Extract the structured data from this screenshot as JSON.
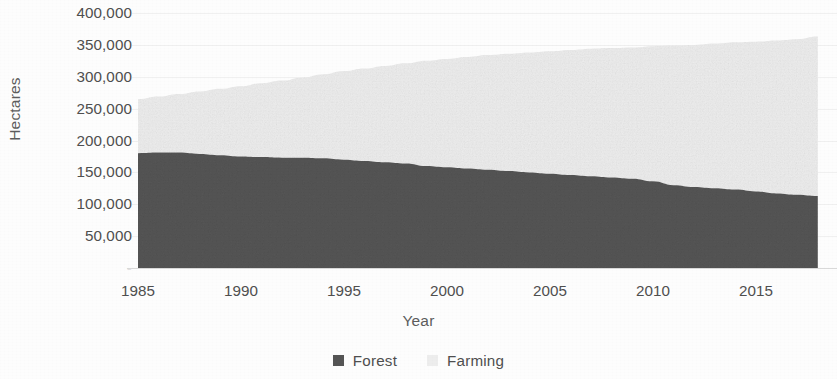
{
  "chart_data": {
    "type": "area",
    "stacked": true,
    "title": "",
    "xlabel": "Year",
    "ylabel": "Hectares",
    "xlim": [
      1985,
      2018
    ],
    "ylim": [
      0,
      400000
    ],
    "grid": true,
    "legend_position": "bottom",
    "y_ticks": [
      0,
      50000,
      100000,
      150000,
      200000,
      250000,
      300000,
      350000,
      400000
    ],
    "y_tick_labels": [
      "-",
      "50,000",
      "100,000",
      "150,000",
      "200,000",
      "250,000",
      "300,000",
      "350,000",
      "400,000"
    ],
    "x_ticks": [
      1985,
      1990,
      1995,
      2000,
      2005,
      2010,
      2015
    ],
    "x_tick_labels": [
      "1985",
      "1990",
      "1995",
      "2000",
      "2005",
      "2010",
      "2015"
    ],
    "x": [
      1985,
      1986,
      1987,
      1988,
      1989,
      1990,
      1991,
      1992,
      1993,
      1994,
      1995,
      1996,
      1997,
      1998,
      1999,
      2000,
      2001,
      2002,
      2003,
      2004,
      2005,
      2006,
      2007,
      2008,
      2009,
      2010,
      2011,
      2012,
      2013,
      2014,
      2015,
      2016,
      2017,
      2018
    ],
    "series": [
      {
        "name": "Forest",
        "color": "#555555",
        "values": [
          180000,
          181000,
          181000,
          179000,
          177000,
          175000,
          174000,
          173000,
          173000,
          172000,
          170000,
          168000,
          166000,
          164000,
          160000,
          158000,
          156000,
          154000,
          152000,
          150000,
          148000,
          146000,
          144000,
          142000,
          140000,
          136000,
          130000,
          127000,
          125000,
          123000,
          120000,
          117000,
          115000,
          113000
        ]
      },
      {
        "name": "Farming",
        "color": "#ededed",
        "values": [
          85000,
          88000,
          92000,
          98000,
          104000,
          110000,
          116000,
          121000,
          126000,
          132000,
          139000,
          145000,
          151000,
          157000,
          165000,
          170000,
          175000,
          180000,
          184000,
          188000,
          192000,
          196000,
          200000,
          203000,
          206000,
          212000,
          219000,
          223000,
          227000,
          231000,
          235000,
          240000,
          244000,
          250000
        ]
      }
    ],
    "totals": [
      265000,
      269000,
      273000,
      277000,
      281000,
      285000,
      290000,
      294000,
      299000,
      304000,
      309000,
      313000,
      317000,
      321000,
      325000,
      328000,
      331000,
      334000,
      336000,
      338000,
      340000,
      342000,
      344000,
      345000,
      346000,
      348000,
      349000,
      350000,
      352000,
      354000,
      355000,
      357000,
      359000,
      363000
    ]
  },
  "legend": {
    "items": [
      {
        "label": "Forest",
        "color": "#555555"
      },
      {
        "label": "Farming",
        "color": "#ededed"
      }
    ]
  },
  "colors": {
    "forest": "#555555",
    "farming": "#ededed",
    "axis_text": "#4f4f4f",
    "title_text": "#5d5d5d",
    "gridline": "#f0f0f0",
    "background": "#fdfdfd"
  }
}
